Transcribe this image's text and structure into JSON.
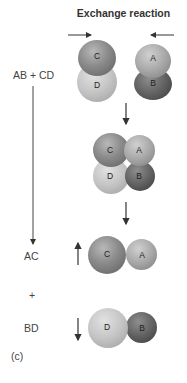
{
  "title": "Exchange reaction",
  "reactants_label": "AB + CD",
  "products": {
    "first": "AC",
    "plus": "+",
    "second": "BD"
  },
  "panel_label": "(c)",
  "atoms": {
    "A": "A",
    "B": "B",
    "C": "C",
    "D": "D"
  },
  "stages": [
    {
      "name": "reactants",
      "molecules": [
        "CD",
        "AB"
      ]
    },
    {
      "name": "intermediate",
      "molecules": [
        "CADB"
      ]
    },
    {
      "name": "products",
      "molecules": [
        "AC",
        "BD"
      ]
    }
  ],
  "colors": {
    "C": "#8a8a8a",
    "D": "#c4c4c4",
    "A": "#a8a8a8",
    "B": "#5e5e5e",
    "arrow": "#333333"
  }
}
